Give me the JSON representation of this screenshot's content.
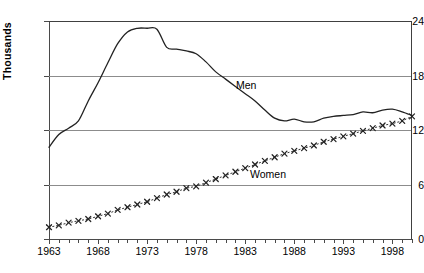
{
  "chart_data": {
    "type": "line",
    "title": "",
    "subtitle": "",
    "xlabel": "",
    "ylabel": "Thousands",
    "xlim": [
      1963,
      2000
    ],
    "ylim": [
      0,
      24
    ],
    "ytick_values": [
      0,
      6,
      12,
      18,
      24
    ],
    "ytick_labels": [
      "0",
      "6",
      "12",
      "18",
      "24"
    ],
    "xtick_labels": [
      "1963",
      "1968",
      "1973",
      "1978",
      "1983",
      "1988",
      "1993",
      "1998"
    ],
    "xtick_label_values": [
      1963,
      1968,
      1973,
      1978,
      1983,
      1988,
      1993,
      1998
    ],
    "xtick_minor_step": 1,
    "grid": "horizontal",
    "grid_color": "#8c8c8c",
    "legend_position": "inline-annotation",
    "annotations": [
      {
        "text": "Men",
        "x": 1983.5,
        "y": 17.2
      },
      {
        "text": "Women",
        "x": 1985.5,
        "y": 7.6
      }
    ],
    "x": [
      1963,
      1964,
      1965,
      1966,
      1967,
      1968,
      1969,
      1970,
      1971,
      1972,
      1973,
      1974,
      1975,
      1976,
      1977,
      1978,
      1979,
      1980,
      1981,
      1982,
      1983,
      1984,
      1985,
      1986,
      1987,
      1988,
      1989,
      1990,
      1991,
      1992,
      1993,
      1994,
      1995,
      1996,
      1997,
      1998,
      1999,
      2000
    ],
    "series": [
      {
        "name": "Men",
        "style": "solid-line",
        "color": "#222222",
        "values": [
          10.1,
          11.5,
          12.2,
          13.0,
          15.2,
          17.2,
          19.4,
          21.5,
          22.8,
          23.2,
          23.2,
          23.1,
          21.1,
          20.9,
          20.7,
          20.4,
          19.5,
          18.4,
          17.6,
          16.8,
          16.0,
          15.2,
          14.2,
          13.3,
          13.0,
          13.2,
          12.9,
          12.9,
          13.3,
          13.5,
          13.6,
          13.7,
          14.0,
          13.9,
          14.2,
          14.3,
          14.0,
          13.6
        ]
      },
      {
        "name": "Women",
        "style": "dotted-line-with-x-markers",
        "color": "#222222",
        "marker": "x",
        "values": [
          1.3,
          1.5,
          1.8,
          2.0,
          2.2,
          2.5,
          2.8,
          3.2,
          3.5,
          3.8,
          4.1,
          4.5,
          4.9,
          5.2,
          5.6,
          5.8,
          6.2,
          6.6,
          7.0,
          7.4,
          7.8,
          8.2,
          8.6,
          9.0,
          9.4,
          9.7,
          10.0,
          10.3,
          10.7,
          11.0,
          11.3,
          11.6,
          11.9,
          12.2,
          12.5,
          12.7,
          13.0,
          13.5
        ]
      }
    ]
  }
}
